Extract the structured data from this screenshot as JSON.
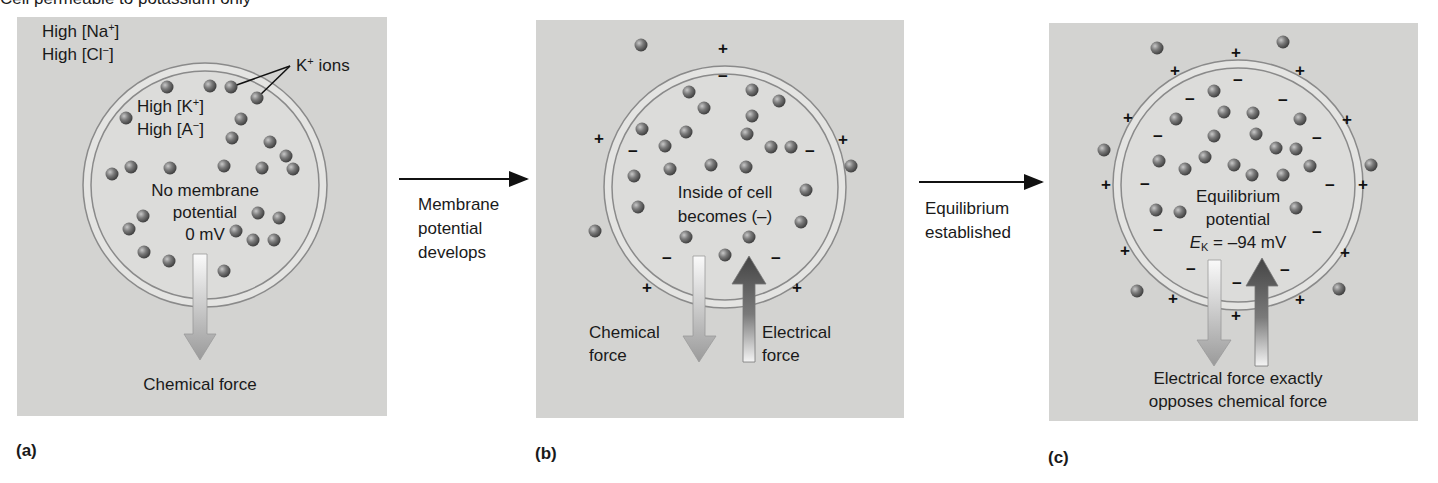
{
  "figure": {
    "top_caption": "Cell permeable to potassium only",
    "transition_arrows": [
      {
        "lines": [
          "Membrane",
          "potential",
          "develops"
        ]
      },
      {
        "lines": [
          "Equilibrium",
          "established"
        ]
      }
    ],
    "panels": [
      {
        "letter": "(a)",
        "extracellular_labels": [
          "High [Na",
          "+",
          "]",
          "High [Cl",
          "−",
          "]"
        ],
        "ion_callout": {
          "base": "K",
          "sup": "+",
          "rest": " ions"
        },
        "intracellular_labels": {
          "k": "High [K",
          "k_sup": "+",
          "k_end": "]",
          "a": "High [A",
          "a_sup": "−",
          "a_end": "]"
        },
        "center_text": [
          "No membrane",
          "potential",
          "0 mV"
        ],
        "force_label": "Chemical force"
      },
      {
        "letter": "(b)",
        "center_text": [
          "Inside of cell",
          "becomes (–)"
        ],
        "chemical_force_label": [
          "Chemical",
          "force"
        ],
        "electrical_force_label": [
          "Electrical",
          "force"
        ]
      },
      {
        "letter": "(c)",
        "center_text": [
          "Equilibrium",
          "potential"
        ],
        "equation": {
          "symbol": "E",
          "subscript": "K",
          "value": " = –94 mV"
        },
        "force_label": [
          "Electrical force exactly",
          "opposes chemical force"
        ]
      }
    ]
  },
  "colors": {
    "panel_bg": "#d3d3d1",
    "cell_interior": "#dcdcda",
    "membrane": "#e4e4e2",
    "membrane_outline": "#8a8a8a",
    "ion": "#6e6e6e",
    "electrical_arrow_dark": "#505050",
    "chemical_arrow_light": "#f4f4f4"
  }
}
